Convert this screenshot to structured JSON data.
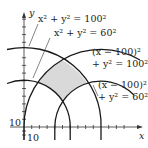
{
  "diagram": {
    "axes": {
      "x_label": "x",
      "y_label": "y",
      "x_tick_label": "10",
      "y_tick_label": "10",
      "tick_step": 10
    },
    "curves": [
      {
        "id": "c1",
        "equation": "x² + y² = 100²",
        "center": [
          0,
          0
        ],
        "radius": 100
      },
      {
        "id": "c2",
        "equation": "x² + y² = 60²",
        "center": [
          0,
          0
        ],
        "radius": 60
      },
      {
        "id": "c3",
        "equation_line1": "(x − 100)²",
        "equation_line2": "+ y² = 100²",
        "center": [
          100,
          0
        ],
        "radius": 100
      },
      {
        "id": "c4",
        "equation_line1": "(x − 100)²",
        "equation_line2": "+ y² = 60²",
        "center": [
          100,
          0
        ],
        "radius": 60
      }
    ],
    "shaded_region": {
      "description": "region inside x²+y²=100², outside x²+y²=60², inside (x−100)²+y²=100², outside (x−100)²+y²=60²",
      "fill": "#d9d9d9"
    },
    "colors": {
      "stroke": "#1a1a1a",
      "shade": "#d9d9d9"
    }
  }
}
